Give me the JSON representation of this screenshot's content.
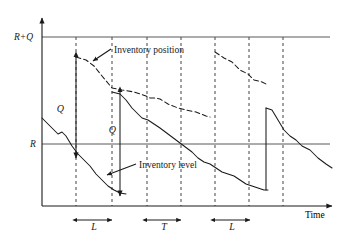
{
  "figure": {
    "background_color": "#ffffff",
    "line_color": "#1a1a1a",
    "grid_color": "#555555"
  },
  "axes": {
    "y_axis_name": "inventory-axis",
    "x_axis_label": "Time",
    "y_tick_labels": [
      {
        "name": "reorder-plus-order-level",
        "text": "R+Q",
        "y_px": 37
      },
      {
        "name": "reorder-point-level",
        "text": "R",
        "y_px": 144
      }
    ],
    "origin_px": {
      "x": 42,
      "y": 206
    },
    "x_axis_end_px": {
      "x": 336,
      "y": 206
    },
    "y_axis_top_px": {
      "x": 42,
      "y": 14
    }
  },
  "reference_lines": [
    {
      "name": "line-R-plus-Q",
      "label": "R+Q",
      "y_px": 37,
      "x_from": 42,
      "x_to": 330
    },
    {
      "name": "line-R",
      "label": "R",
      "y_px": 144,
      "x_from": 42,
      "x_to": 330
    }
  ],
  "review_gridlines": [
    {
      "name": "review-gridline-1",
      "x_px": 76
    },
    {
      "name": "review-gridline-2",
      "x_px": 112
    },
    {
      "name": "review-gridline-3",
      "x_px": 147
    },
    {
      "name": "review-gridline-4",
      "x_px": 181
    },
    {
      "name": "review-gridline-5",
      "x_px": 215
    },
    {
      "name": "review-gridline-6",
      "x_px": 249
    },
    {
      "name": "review-gridline-7",
      "x_px": 283
    }
  ],
  "curves": [
    {
      "name": "inventory-position-curve",
      "style": "dashed",
      "label": "Inventory position",
      "points": "76,57 86,60 94,66 102,76 112,88 122,90 134,92 146,96 150,98 156,98 160,99 168,104 178,108 186,110 196,112 206,116 210,116 215,52 224,58 232,62 240,70 248,74 254,80 262,82 268,84 272,86 278,92 282,96 288,100 296,106 304,108 312,114 320,120 328,124"
    },
    {
      "name": "inventory-level-curve",
      "style": "solid",
      "label": "Inventory level",
      "points": "42,118 48,124 54,130 58,134 62,132 66,136 72,146 78,154 84,160 90,166 96,174 102,180 108,186 112,190 118,192 112,92 120,94 126,100 132,108 138,114 142,118 148,120 154,124 160,128 168,134 176,140 184,146 192,152 198,158 204,162 210,164 216,168 222,172 228,174 234,176 240,180 246,184 252,186 258,188 264,190 266,190 266,108 272,110 278,120 284,130 290,136 296,140 302,146 310,150 318,158 326,164 332,168"
    }
  ],
  "annotations": [
    {
      "name": "order-quantity-label-1",
      "text": "Q",
      "x_px": 68,
      "y_px": 110,
      "arrow_x": 76,
      "arrow_top": 57,
      "arrow_bottom": 158
    },
    {
      "name": "order-quantity-label-2",
      "text": "Q",
      "x_px": 112,
      "y_px": 130,
      "arrow_x": 120,
      "arrow_top": 92,
      "arrow_bottom": 196
    },
    {
      "name": "inventory-position-annotation",
      "text": "Inventory position",
      "x_px": 113,
      "y_px": 52,
      "pointer_from": {
        "x": 111,
        "y": 50
      },
      "pointer_to": {
        "x": 92,
        "y": 62
      }
    },
    {
      "name": "inventory-level-annotation",
      "text": "Inventory level",
      "x_px": 138,
      "y_px": 167,
      "pointer_from": {
        "x": 136,
        "y": 164
      },
      "pointer_to": {
        "x": 106,
        "y": 176
      }
    }
  ],
  "interval_markers": [
    {
      "name": "lead-time-marker-1",
      "label": "L",
      "x_from": 77,
      "x_to": 112,
      "y_px": 222
    },
    {
      "name": "review-period-marker",
      "label": "T",
      "x_from": 147,
      "x_to": 181,
      "y_px": 222
    },
    {
      "name": "lead-time-marker-2",
      "label": "L",
      "x_from": 215,
      "x_to": 250,
      "y_px": 222
    }
  ]
}
